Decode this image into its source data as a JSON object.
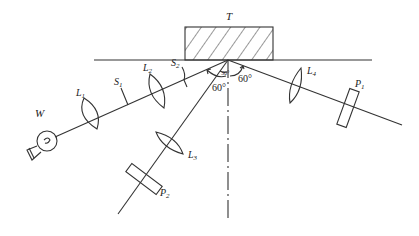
{
  "diagram": {
    "target_label": "T",
    "source_label": "W",
    "labels": {
      "L1": {
        "main": "L",
        "sub": "1"
      },
      "L2": {
        "main": "L",
        "sub": "2"
      },
      "L3": {
        "main": "L",
        "sub": "3"
      },
      "L4": {
        "main": "L",
        "sub": "4"
      },
      "S1": {
        "main": "S",
        "sub": "1"
      },
      "S2": {
        "main": "S",
        "sub": "2"
      },
      "P1": {
        "main": "P",
        "sub": "1"
      },
      "P2": {
        "main": "P",
        "sub": "2"
      }
    },
    "angles": {
      "incident_left": "60°",
      "reflected_right": "60°",
      "between_beams": "30°"
    },
    "colors": {
      "stroke": "#333333",
      "background": "#ffffff"
    }
  }
}
